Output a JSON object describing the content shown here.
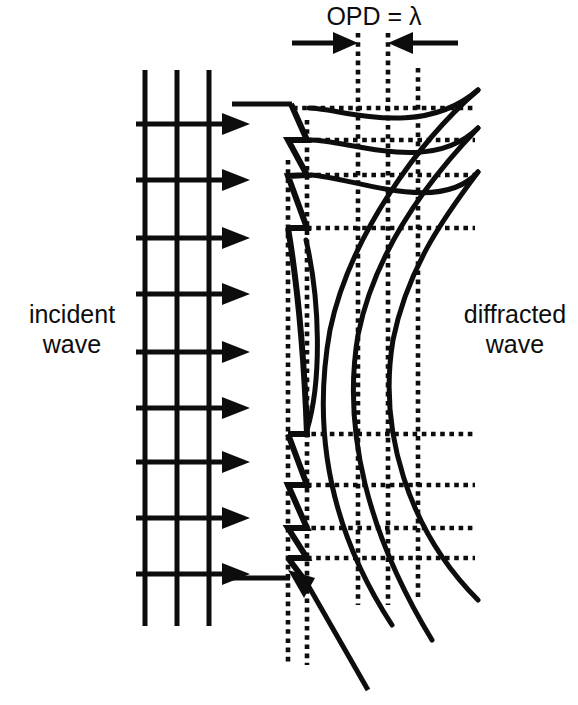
{
  "figure": {
    "background_color": "#ffffff",
    "ink_color": "#0d0d0d",
    "width": 578,
    "height": 705
  },
  "labels": {
    "incident": "incident\nwave",
    "diffracted": "diffracted\nwave",
    "opd": "OPD = λ"
  },
  "annotation": {
    "opd_text": "OPD = λ",
    "opd_symbol": "λ",
    "opd_left_arrow": "arrow-right",
    "opd_right_arrow": "arrow-left",
    "opd_span_start_x": 358,
    "opd_span_end_x": 388
  },
  "incident_wave": {
    "wavefront_count": 3,
    "wavefront_x": [
      145,
      177,
      209
    ],
    "wavefront_top_y": 70,
    "wavefront_bottom_y": 626,
    "ray_count": 6,
    "ray_y": [
      124,
      180,
      238,
      294,
      352,
      408
    ],
    "ray_x_start": 136,
    "ray_x_end": 232,
    "ray_marker": "arrow-right"
  },
  "grating": {
    "type": "blazed-sawtooth",
    "facet_count": 8,
    "top_y": 104,
    "bottom_y": 600,
    "groove_x_left": 288,
    "groove_x_right": 307,
    "blaze_note": "sawtooth profile with curved central facets"
  },
  "diffracted_wave": {
    "wavefront_count": 3,
    "curve_style": "arc",
    "description": "three curved diffracted wavefronts fanning out to the right"
  },
  "construction_grid": {
    "vertical_dotted_x": [
      288,
      307,
      358,
      388,
      418
    ],
    "horizontal_dotted_y": [
      108,
      140,
      175,
      228,
      434,
      485,
      528,
      558
    ],
    "dotted_right_edge_x": 475,
    "line_style": "dotted"
  }
}
